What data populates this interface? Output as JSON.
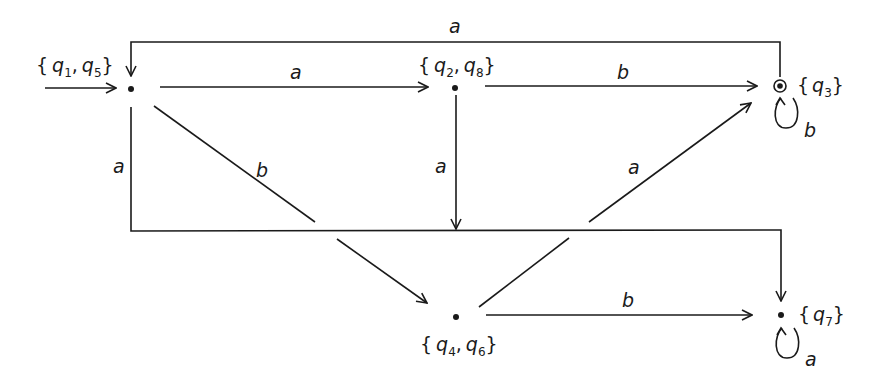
{
  "diagram": {
    "type": "DFA state diagram (subset construction)",
    "states": [
      {
        "id": "s15",
        "label": "{q1, q5}",
        "parts": [
          {
            "q": "q",
            "sub": "1"
          },
          {
            "q": "q",
            "sub": "5"
          }
        ],
        "x": 131,
        "y": 89,
        "start": true,
        "accepting": false
      },
      {
        "id": "s28",
        "label": "{q2, q8}",
        "parts": [
          {
            "q": "q",
            "sub": "2"
          },
          {
            "q": "q",
            "sub": "8"
          }
        ],
        "x": 455,
        "y": 88,
        "start": false,
        "accepting": false
      },
      {
        "id": "s3",
        "label": "{q3}",
        "parts": [
          {
            "q": "q",
            "sub": "3"
          }
        ],
        "x": 780,
        "y": 86,
        "start": false,
        "accepting": true
      },
      {
        "id": "s46",
        "label": "{q4, q6}",
        "parts": [
          {
            "q": "q",
            "sub": "4"
          },
          {
            "q": "q",
            "sub": "6"
          }
        ],
        "x": 456,
        "y": 317,
        "start": false,
        "accepting": false
      },
      {
        "id": "s7",
        "label": "{q7}",
        "parts": [
          {
            "q": "q",
            "sub": "7"
          }
        ],
        "x": 781,
        "y": 315,
        "start": false,
        "accepting": false
      }
    ],
    "transitions": [
      {
        "from": "s15",
        "to": "s28",
        "symbol": "a"
      },
      {
        "from": "s28",
        "to": "s3",
        "symbol": "b"
      },
      {
        "from": "s3",
        "to": "s15",
        "symbol": "a"
      },
      {
        "from": "s3",
        "to": "s3",
        "symbol": "b"
      },
      {
        "from": "s15",
        "to": "s7",
        "symbol": "a"
      },
      {
        "from": "s15",
        "to": "s46",
        "symbol": "b"
      },
      {
        "from": "s28",
        "to": "s7",
        "symbol": "a"
      },
      {
        "from": "s46",
        "to": "s3",
        "symbol": "a"
      },
      {
        "from": "s46",
        "to": "s7",
        "symbol": "b"
      },
      {
        "from": "s7",
        "to": "s7",
        "symbol": "a"
      }
    ],
    "labels": {
      "top_a": "a",
      "s15_s28": "a",
      "s28_s3": "b",
      "s3_loop": "b",
      "left_a": "a",
      "diag_b": "b",
      "mid_a": "a",
      "diag_a": "a",
      "s46_s7": "b",
      "s7_loop": "a"
    },
    "set_text": {
      "open": "{",
      "close": "}",
      "comma": ",",
      "q": "q",
      "s15": {
        "sub1": "1",
        "sub2": "5"
      },
      "s28": {
        "sub1": "2",
        "sub2": "8"
      },
      "s3": {
        "sub1": "3"
      },
      "s46": {
        "sub1": "4",
        "sub2": "6"
      },
      "s7": {
        "sub1": "7"
      }
    }
  }
}
